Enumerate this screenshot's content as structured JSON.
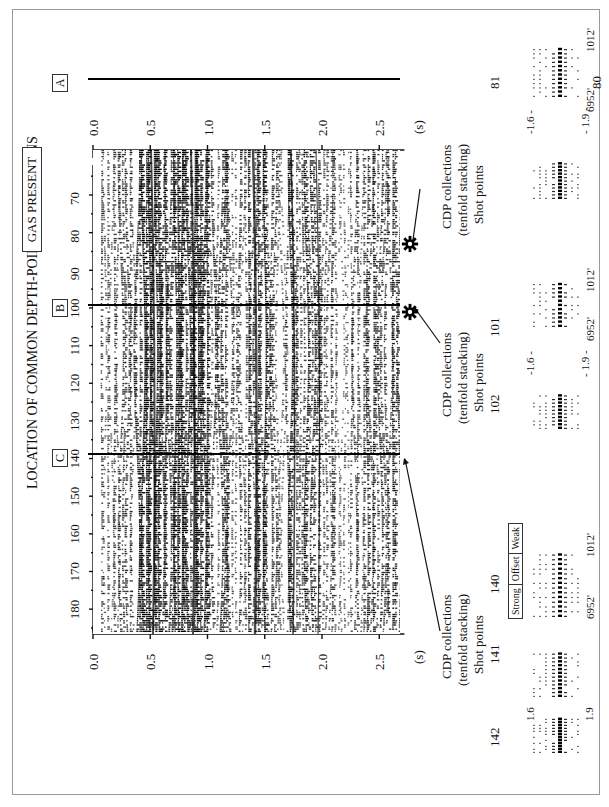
{
  "title": "LOCATION OF COMMON DEPTH-POINT COLLECTIONS",
  "banner": "GAS PRESENT",
  "markers": [
    {
      "label": "A",
      "cdp": 82
    },
    {
      "label": "B",
      "cdp": 102
    },
    {
      "label": "C",
      "cdp": 141
    }
  ],
  "cdp_axis": {
    "ticks": [
      "70",
      "80",
      "90",
      "100",
      "110",
      "120",
      "130",
      "140",
      "150",
      "160",
      "170",
      "180"
    ]
  },
  "time_axis": {
    "ticks": [
      "0.0",
      "0.5",
      "1.0",
      "1.5",
      "2.0",
      "2.5"
    ],
    "unit": "(s)"
  },
  "callouts": [
    {
      "line1": "CDP collections",
      "line2": "(tenfold stacking)",
      "line3": "Shot points",
      "shots": [
        "81",
        "80"
      ],
      "gas": true
    },
    {
      "line1": "CDP collections",
      "line2": "(tenfold stacking)",
      "line3": "Shot points",
      "shots": [
        "102",
        "101"
      ],
      "gas": true
    },
    {
      "line1": "CDP collections",
      "line2": "(tenfold stacking)",
      "line3": "Shot points",
      "shots": [
        "142",
        "141",
        "140"
      ],
      "gas": false
    }
  ],
  "gather_labels": {
    "top_time": "1.6",
    "bottom_time": "1.9",
    "top_time_dashed": "-1.6 -",
    "bottom_time_dashed": "- 1.9 -",
    "near_offset": "6952'",
    "far_offset": "1012'"
  },
  "amplitude_legend": [
    "Strong",
    "Offset",
    "Weak"
  ],
  "icons": {
    "gas": "gear-icon"
  }
}
